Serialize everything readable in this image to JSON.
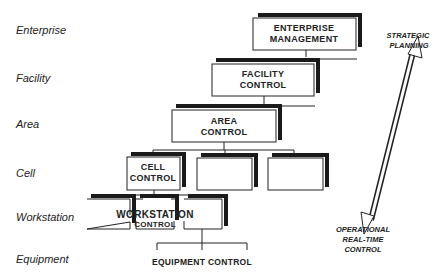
{
  "levels": [
    {
      "label": "Enterprise"
    },
    {
      "label": "Facility"
    },
    {
      "label": "Area"
    },
    {
      "label": "Cell"
    },
    {
      "label": "Workstation"
    },
    {
      "label": "Equipment"
    }
  ],
  "boxes": {
    "enterprise": {
      "line1": "ENTERPRISE",
      "line2": "MANAGEMENT"
    },
    "facility": {
      "line1": "FACILITY",
      "line2": "CONTROL"
    },
    "area": {
      "line1": "AREA",
      "line2": "CONTROL"
    },
    "cell": {
      "line1": "CELL",
      "line2": "CONTROL"
    },
    "workstation": {
      "line1": "WORKSTATION",
      "line2": "CONTROL"
    },
    "equipment": {
      "label": "EQUIPMENT CONTROL"
    }
  },
  "arrow": {
    "top_line1": "STRATEGIC",
    "top_line2": "PLANNING",
    "bottom_line1": "OPERATIONAL",
    "bottom_line2": "REAL-TIME",
    "bottom_line3": "CONTROL"
  },
  "colors": {
    "ink": "#222222",
    "shadow": "#1a1a1a",
    "background": "#ffffff"
  }
}
